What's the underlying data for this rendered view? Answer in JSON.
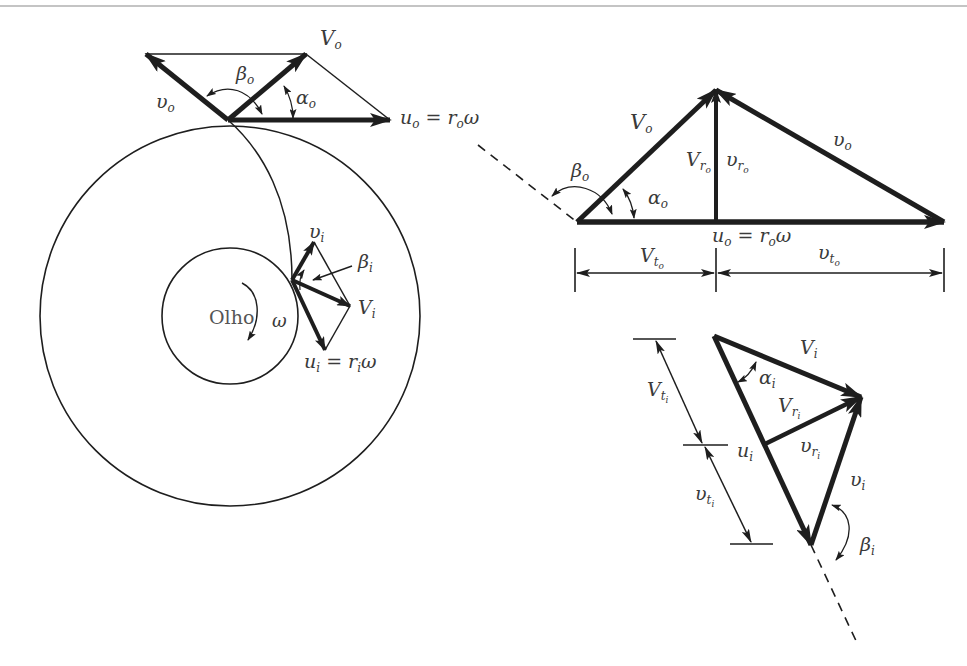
{
  "figure": {
    "impeller": {
      "eye_label": "Olho",
      "omega_inner": "ω",
      "outlet_labels": {
        "V": "V",
        "V_sub": "o",
        "v_rel": "υ",
        "v_rel_sub": "o",
        "beta": "β",
        "beta_sub": "o",
        "alpha": "α",
        "alpha_sub": "o",
        "u_eq": "u",
        "u_eq_sub": "o",
        "u_eq_rhs": " = r",
        "u_eq_rhs_sub": "o",
        "u_eq_tail": "ω"
      },
      "inlet_labels": {
        "v_rel": "υ",
        "v_rel_sub": "i",
        "beta": "β",
        "beta_sub": "i",
        "V": "V",
        "V_sub": "i",
        "u_eq": "u",
        "u_eq_sub": "i",
        "u_eq_rhs": " = r",
        "u_eq_rhs_sub": "i",
        "u_eq_tail": "ω"
      }
    },
    "outlet_triangle": {
      "V": "V",
      "V_sub": "o",
      "v_rel": "υ",
      "v_rel_sub": "o",
      "Vr": "V",
      "Vr_sub": "r",
      "Vr_subsub": "o",
      "vr": "υ",
      "vr_sub": "r",
      "vr_subsub": "o",
      "beta": "β",
      "beta_sub": "o",
      "alpha": "α",
      "alpha_sub": "o",
      "u_eq": "u",
      "u_eq_sub": "o",
      "u_eq_rhs": " = r",
      "u_eq_rhs_sub": "o",
      "u_eq_tail": "ω",
      "Vt": "V",
      "Vt_sub": "t",
      "Vt_subsub": "o",
      "vt": "υ",
      "vt_sub": "t",
      "vt_subsub": "o"
    },
    "inlet_triangle": {
      "V": "V",
      "V_sub": "i",
      "alpha": "α",
      "alpha_sub": "i",
      "Vr": "V",
      "Vr_sub": "r",
      "Vr_subsub": "i",
      "vr": "υ",
      "vr_sub": "r",
      "vr_subsub": "i",
      "u": "u",
      "u_sub": "i",
      "v_rel": "υ",
      "v_rel_sub": "i",
      "beta": "β",
      "beta_sub": "i",
      "Vt": "V",
      "Vt_sub": "t",
      "Vt_subsub": "i",
      "vt": "υ",
      "vt_sub": "t",
      "vt_subsub": "i"
    },
    "colors": {
      "ink": "#1e1e1e",
      "text": "#3a3a3a",
      "background": "#ffffff"
    }
  }
}
